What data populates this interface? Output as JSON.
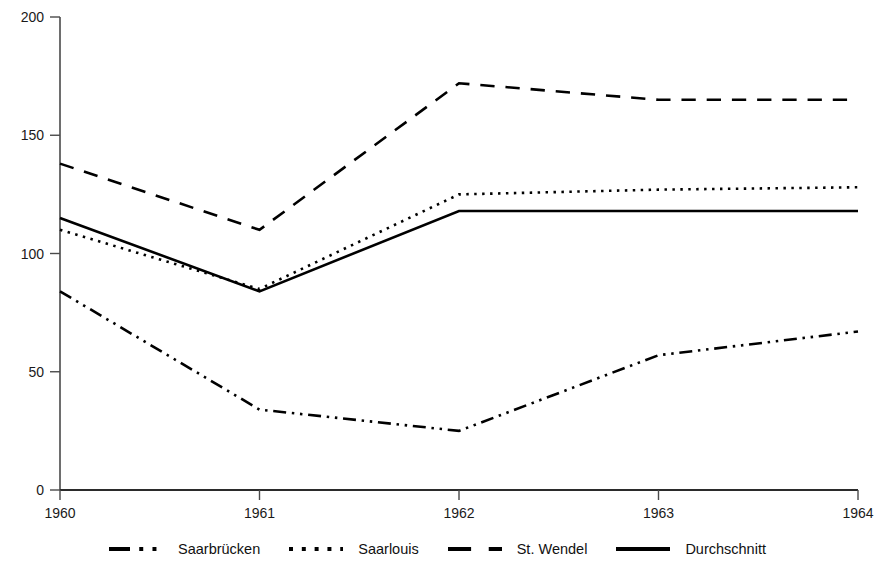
{
  "chart_data": {
    "type": "line",
    "title": "",
    "xlabel": "",
    "ylabel": "",
    "categories": [
      "1960",
      "1961",
      "1962",
      "1963",
      "1964"
    ],
    "x": [
      1960,
      1961,
      1962,
      1963,
      1964
    ],
    "xlim": [
      1960,
      1964
    ],
    "ylim": [
      0,
      200
    ],
    "y_ticks": [
      0,
      50,
      100,
      150,
      200
    ],
    "y_tick_labels": [
      "0",
      "50",
      "100",
      "150",
      "200"
    ],
    "x_tick_labels": [
      "1960",
      "1961",
      "1962",
      "1963",
      "1964"
    ],
    "grid": false,
    "legend_position": "bottom",
    "series": [
      {
        "name": "Saarbrücken",
        "style": "dash-dot-dot",
        "color": "#000000",
        "values": [
          84,
          34,
          25,
          57,
          67
        ]
      },
      {
        "name": "Saarlouis",
        "style": "dotted",
        "color": "#000000",
        "values": [
          110,
          85,
          125,
          127,
          128
        ]
      },
      {
        "name": "St. Wendel",
        "style": "dashed",
        "color": "#000000",
        "values": [
          138,
          110,
          172,
          165,
          165
        ]
      },
      {
        "name": "Durchschnitt",
        "style": "solid",
        "color": "#000000",
        "values": [
          115,
          84,
          118,
          118,
          118
        ]
      }
    ]
  },
  "axis": {
    "y_top_label": "200",
    "y_150_label": "150",
    "y_100_label": "100",
    "y_50_label": "50",
    "y_0_label": "0",
    "x_1960": "1960",
    "x_1961": "1961",
    "x_1962": "1962",
    "x_1963": "1963",
    "x_1964": "1964"
  },
  "legend": {
    "entries": [
      {
        "label": "Saarbrücken",
        "style": "dash-dot-dot"
      },
      {
        "label": "Saarlouis",
        "style": "dotted"
      },
      {
        "label": "St. Wendel",
        "style": "dashed"
      },
      {
        "label": "Durchschnitt",
        "style": "solid"
      }
    ]
  },
  "colors": {
    "line": "#000000",
    "axis": "#4a4a4a",
    "text": "#1a1a1a",
    "background": "#ffffff"
  }
}
